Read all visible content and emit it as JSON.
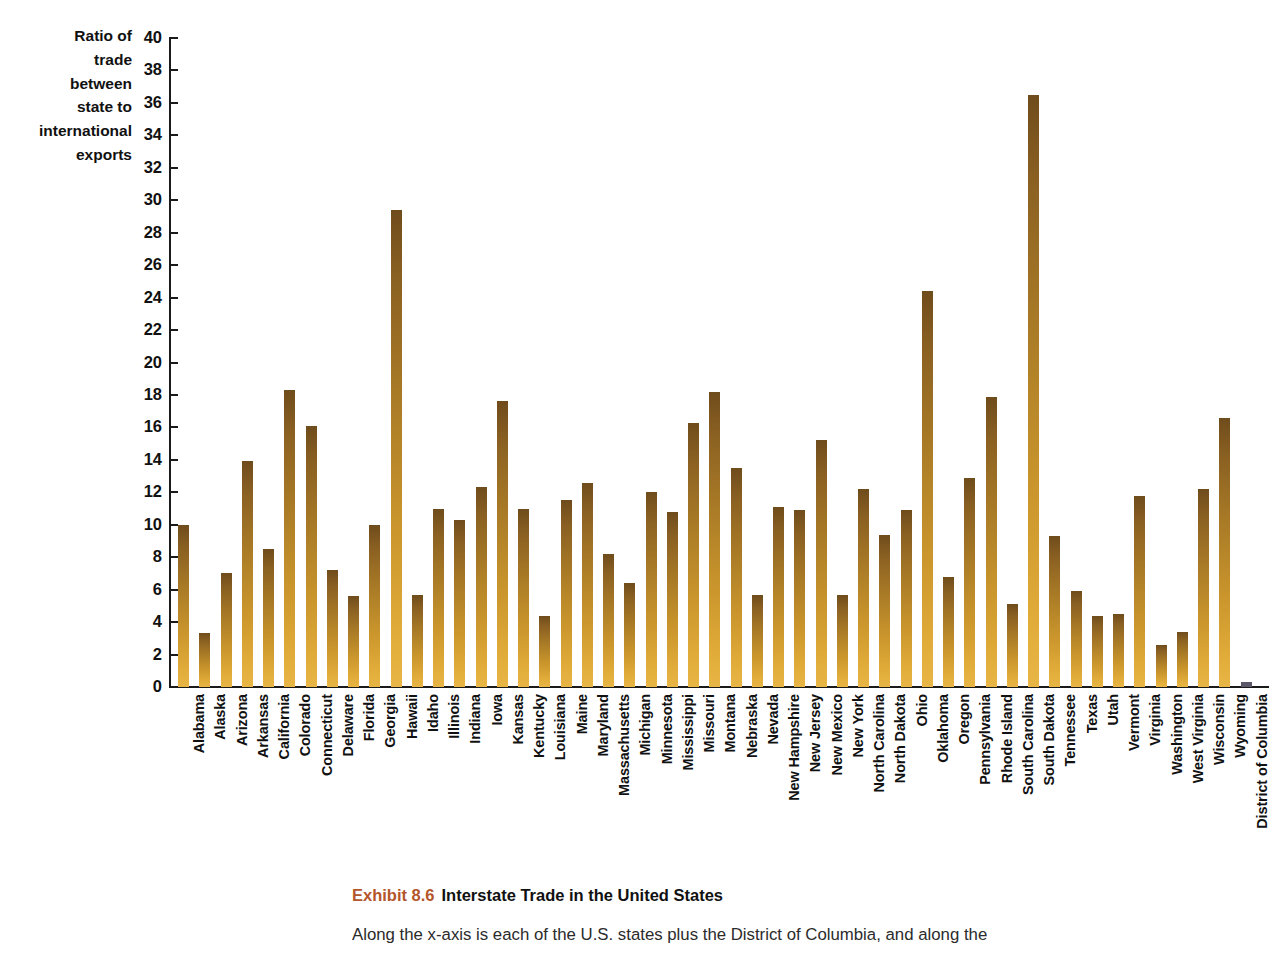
{
  "chart_data": {
    "type": "bar",
    "title": "Interstate Trade in the United States",
    "xlabel": "",
    "ylabel": "Ratio of trade between state to international exports",
    "ylim": [
      0,
      40
    ],
    "ytick_step": 2,
    "grid": false,
    "legend": null,
    "bar_color": "#b07d28",
    "categories": [
      "Alabama",
      "Alaska",
      "Arizona",
      "Arkansas",
      "California",
      "Colorado",
      "Connecticut",
      "Delaware",
      "Florida",
      "Georgia",
      "Hawaii",
      "Idaho",
      "Illinois",
      "Indiana",
      "Iowa",
      "Kansas",
      "Kentucky",
      "Louisiana",
      "Maine",
      "Maryland",
      "Massachusetts",
      "Michigan",
      "Minnesota",
      "Mississippi",
      "Missouri",
      "Montana",
      "Nebraska",
      "Nevada",
      "New Hampshire",
      "New Jersey",
      "New Mexico",
      "New York",
      "North Carolina",
      "North Dakota",
      "Ohio",
      "Oklahoma",
      "Oregon",
      "Pennsylvania",
      "Rhode Island",
      "South Carolina",
      "South Dakota",
      "Tennessee",
      "Texas",
      "Utah",
      "Vermont",
      "Virginia",
      "Washington",
      "West Virginia",
      "Wisconsin",
      "Wyoming",
      "District of Columbia"
    ],
    "values": [
      10.0,
      3.3,
      7.0,
      13.9,
      8.5,
      18.3,
      16.1,
      7.2,
      5.6,
      10.0,
      29.4,
      5.7,
      11.0,
      10.3,
      12.3,
      17.6,
      11.0,
      4.4,
      11.5,
      12.6,
      8.2,
      6.4,
      12.0,
      10.8,
      16.3,
      18.2,
      13.5,
      5.7,
      11.1,
      10.9,
      15.2,
      5.7,
      12.2,
      9.4,
      10.9,
      24.4,
      6.8,
      12.9,
      17.9,
      5.1,
      36.5,
      9.3,
      5.9,
      4.4,
      4.5,
      11.8,
      2.6,
      3.4,
      12.2,
      16.6,
      0.3
    ]
  },
  "y_axis": {
    "ticks": [
      40,
      38,
      36,
      34,
      32,
      30,
      28,
      26,
      24,
      22,
      20,
      18,
      16,
      14,
      12,
      10,
      8,
      6,
      4,
      2,
      0
    ],
    "title_lines": "Ratio of\ntrade\nbetween\nstate to\ninternational\nexports"
  },
  "caption": {
    "exhibit_number": "Exhibit 8.6",
    "title": "Interstate Trade in the United States",
    "body": "Along the x-axis is each of the U.S. states plus the District of Columbia, and along the"
  }
}
